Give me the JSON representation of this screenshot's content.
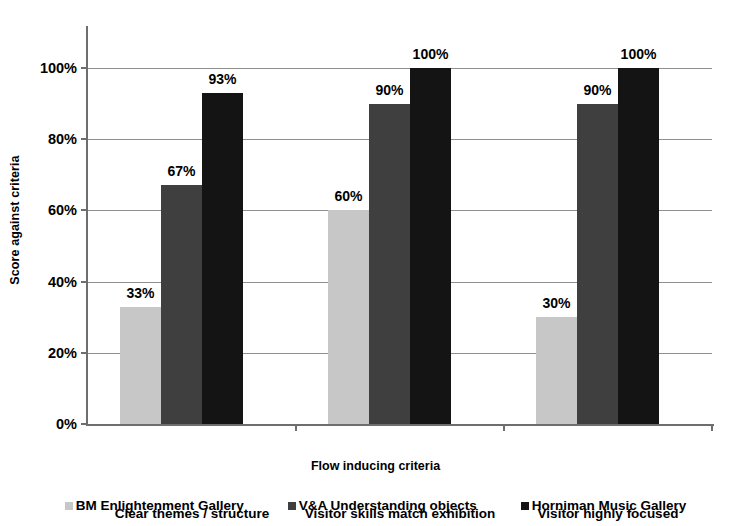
{
  "chart_data": {
    "type": "bar",
    "title": "",
    "xlabel": "Flow inducing criteria",
    "ylabel": "Score against criteria",
    "categories": [
      "Clear themes / structure",
      "Visitor skills match exhibition",
      "Visitor highly focused"
    ],
    "series": [
      {
        "name": "BM Enlightenment Gallery",
        "color": "#c7c7c7",
        "values": [
          33,
          60,
          30
        ],
        "labels": [
          "33%",
          "60%",
          "30%"
        ]
      },
      {
        "name": "V&A Understanding objects",
        "color": "#3f3f3f",
        "values": [
          67,
          90,
          90
        ],
        "labels": [
          "67%",
          "90%",
          "90%"
        ]
      },
      {
        "name": "Horniman Music Gallery",
        "color": "#141414",
        "values": [
          93,
          100,
          100
        ],
        "labels": [
          "93%",
          "100%",
          "100%"
        ]
      }
    ],
    "ylim": [
      0,
      100
    ],
    "yticks": [
      0,
      20,
      40,
      60,
      80,
      100
    ],
    "ytick_labels": [
      "0%",
      "20%",
      "40%",
      "60%",
      "80%",
      "100%"
    ],
    "grid": true,
    "legend_position": "bottom"
  },
  "axes": {
    "y_title": "Score against criteria",
    "x_title": "Flow inducing criteria",
    "y_ticks": [
      {
        "value": 100,
        "label": "100%"
      },
      {
        "value": 80,
        "label": "80%"
      },
      {
        "value": 60,
        "label": "60%"
      },
      {
        "value": 40,
        "label": "40%"
      },
      {
        "value": 20,
        "label": "20%"
      },
      {
        "value": 0,
        "label": "0%"
      }
    ]
  },
  "legend": {
    "items": [
      {
        "label": "BM Enlightenment Gallery",
        "swatch": "s0"
      },
      {
        "label": "V&A Understanding objects",
        "swatch": "s1"
      },
      {
        "label": "Horniman Music Gallery",
        "swatch": "s2"
      }
    ]
  }
}
